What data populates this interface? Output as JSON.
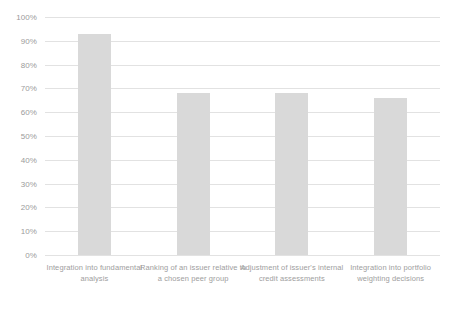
{
  "chart_data": {
    "type": "bar",
    "title": "",
    "xlabel": "",
    "ylabel": "",
    "ylim": [
      0,
      100
    ],
    "grid": true,
    "legend": false,
    "categories": [
      "Integration into fundamental analysis",
      "Ranking of an issuer relative to a chosen peer group",
      "Adjustment of issuer's internal credit assessments",
      "Integration into portfolio weighting decisions"
    ],
    "values": [
      93,
      68,
      68,
      66
    ],
    "y_tick_labels": [
      "100%",
      "90%",
      "80%",
      "70%",
      "60%",
      "50%",
      "40%",
      "30%",
      "20%",
      "10%",
      "0%"
    ],
    "y_tick_values": [
      100,
      90,
      80,
      70,
      60,
      50,
      40,
      30,
      20,
      10,
      0
    ],
    "bar_color": "#d9d9d9",
    "gridline_color": "#e2e2e2",
    "tick_label_color": "#9b9b9b",
    "category_label_color": "#9e9e9e",
    "background_color": "#ffffff"
  }
}
